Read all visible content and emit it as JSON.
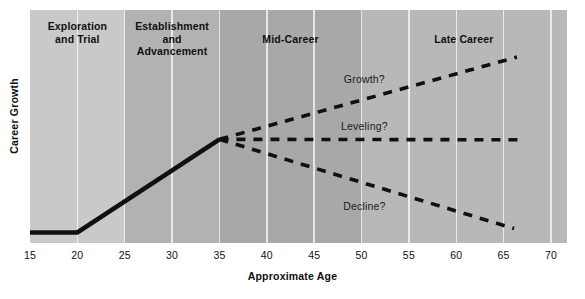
{
  "chart_data": {
    "type": "line",
    "title": "",
    "xlabel": "Approximate Age",
    "ylabel": "Career Growth",
    "xlim": [
      15,
      70
    ],
    "xticks": [
      15,
      20,
      25,
      30,
      35,
      40,
      45,
      50,
      55,
      60,
      65,
      70
    ],
    "ylim": [
      0,
      1
    ],
    "grid": true,
    "legend": "none",
    "stages": [
      {
        "label": "Exploration\nand Trial",
        "label_lines": [
          "Exploration",
          "and Trial"
        ],
        "x_start": 15,
        "x_end": 25,
        "color": "#c9c9c9"
      },
      {
        "label": "Establishment\nand\nAdvancement",
        "label_lines": [
          "Establishment",
          "and",
          "Advancement"
        ],
        "x_start": 25,
        "x_end": 35,
        "color": "#b2b2b2"
      },
      {
        "label": "Mid-Career",
        "label_lines": [
          "Mid-Career"
        ],
        "x_start": 35,
        "x_end": 50,
        "color": "#a8a8a8"
      },
      {
        "label": "Late Career",
        "label_lines": [
          "Late Career"
        ],
        "x_start": 50,
        "x_end": 70,
        "color": "#b8b8b8"
      }
    ],
    "series": [
      {
        "name": "Career path",
        "style": "solid",
        "points": [
          [
            15,
            0.045
          ],
          [
            20,
            0.045
          ],
          [
            35,
            0.445
          ]
        ]
      },
      {
        "name": "Growth?",
        "style": "dashed",
        "points": [
          [
            35,
            0.445
          ],
          [
            66.4,
            0.798
          ]
        ]
      },
      {
        "name": "Leveling?",
        "style": "dashed",
        "points": [
          [
            35,
            0.445
          ],
          [
            66.8,
            0.443
          ]
        ]
      },
      {
        "name": "Decline?",
        "style": "dashed",
        "points": [
          [
            35,
            0.445
          ],
          [
            66.1,
            0.062
          ]
        ]
      }
    ],
    "annotations": [
      {
        "text": "Growth?",
        "x": 50.3,
        "y": 0.7
      },
      {
        "text": "Leveling?",
        "x": 50.3,
        "y": 0.5
      },
      {
        "text": "Decline?",
        "x": 50.3,
        "y": 0.155
      }
    ]
  },
  "axis": {
    "x_label": "Approximate Age",
    "y_label": "Career Growth",
    "x_tick_labels": [
      "15",
      "20",
      "25",
      "30",
      "35",
      "40",
      "45",
      "50",
      "55",
      "60",
      "65",
      "70"
    ]
  },
  "stage_labels": {
    "exploration": [
      "Exploration",
      "and Trial"
    ],
    "establishment": [
      "Establishment",
      "and",
      "Advancement"
    ],
    "mid_career": [
      "Mid-Career"
    ],
    "late_career": [
      "Late Career"
    ]
  },
  "annotation_labels": {
    "growth": "Growth?",
    "leveling": "Leveling?",
    "decline": "Decline?"
  },
  "colors": {
    "band_exploration": "#c9c9c9",
    "band_establishment": "#b2b2b2",
    "band_mid": "#a8a8a8",
    "band_late": "#b8b8b8",
    "line": "#101010",
    "gridline": "#ffffff",
    "text": "#101010",
    "page_background": "#ffffff"
  }
}
